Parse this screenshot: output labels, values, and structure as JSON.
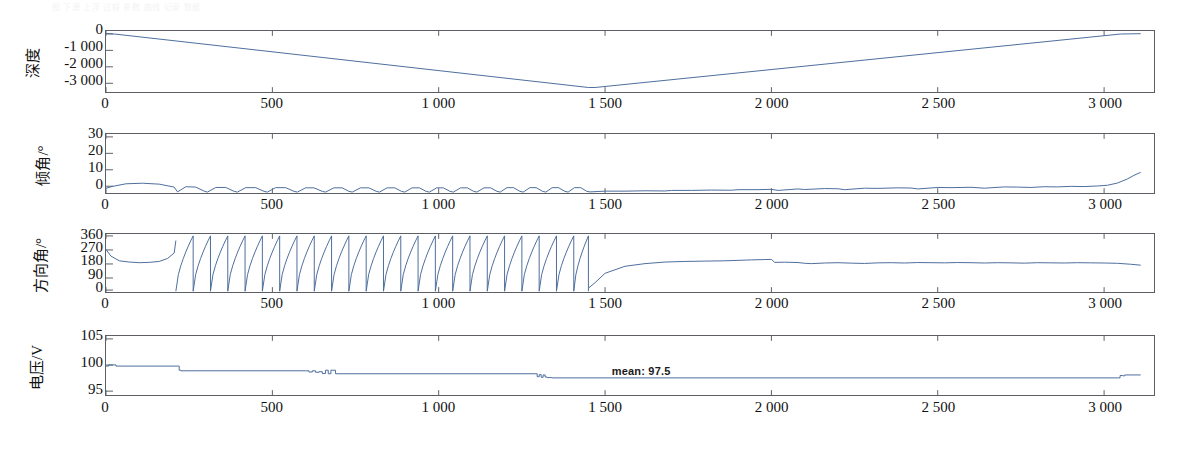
{
  "figure": {
    "ghost_caption": "图 下潜 上浮 过程 参数 曲线 记录 数据",
    "trace_color": "#4a6c9b",
    "axis_color": "#5b5f63",
    "background": "#ffffff"
  },
  "chart_data": [
    {
      "type": "line",
      "panel_index": 0,
      "title": "",
      "ylabel": "深度",
      "xlabel": "",
      "xlim": [
        0,
        3150
      ],
      "ylim": [
        -3500,
        150
      ],
      "yticks": [
        0,
        -1000,
        -2000,
        -3000
      ],
      "ytick_labels": [
        "0",
        "-1 000",
        "-2 000",
        "-3 000"
      ],
      "xticks": [
        0,
        500,
        1000,
        1500,
        2000,
        2500,
        3000
      ],
      "xtick_labels": [
        "0",
        "500",
        "1 000",
        "1 500",
        "2 000",
        "2 500",
        "3 000"
      ],
      "grid": false,
      "legend": "none",
      "series": [
        {
          "name": "深度",
          "x": [
            0,
            30,
            1450,
            1470,
            3050,
            3110
          ],
          "values": [
            0,
            -40,
            -3230,
            -3230,
            -30,
            -10
          ]
        }
      ]
    },
    {
      "type": "line",
      "panel_index": 1,
      "title": "",
      "ylabel": "倾角/°",
      "xlabel": "",
      "xlim": [
        0,
        3150
      ],
      "ylim": [
        0,
        32
      ],
      "yticks": [
        0,
        10,
        20,
        30
      ],
      "ytick_labels": [
        "0",
        "10",
        "20",
        "30"
      ],
      "xticks": [
        0,
        500,
        1000,
        1500,
        2000,
        2500,
        3000
      ],
      "xtick_labels": [
        "0",
        "500",
        "1 000",
        "1 500",
        "2 000",
        "2 500",
        "3 000"
      ],
      "grid": false,
      "legend": "none",
      "series": [
        {
          "name": "倾角",
          "x": [
            0,
            20,
            60,
            110,
            160,
            205,
            215,
            240,
            270,
            295,
            305,
            330,
            360,
            385,
            395,
            420,
            450,
            475,
            485,
            510,
            540,
            565,
            575,
            600,
            625,
            650,
            660,
            685,
            710,
            730,
            740,
            765,
            790,
            812,
            822,
            845,
            868,
            888,
            898,
            920,
            942,
            962,
            972,
            994,
            1014,
            1034,
            1044,
            1066,
            1086,
            1105,
            1115,
            1136,
            1156,
            1175,
            1185,
            1205,
            1225,
            1244,
            1254,
            1274,
            1293,
            1312,
            1322,
            1341,
            1360,
            1379,
            1389,
            1408,
            1427,
            1445,
            1455,
            1500,
            1560,
            1620,
            1680,
            1700,
            1760,
            1820,
            1880,
            1900,
            1960,
            2000,
            2020,
            2080,
            2100,
            2160,
            2200,
            2220,
            2280,
            2320,
            2380,
            2420,
            2440,
            2500,
            2540,
            2600,
            2640,
            2700,
            2740,
            2780,
            2820,
            2860,
            2900,
            2940,
            2980,
            3010,
            3040,
            3070,
            3090,
            3110
          ],
          "values": [
            2.6,
            3.6,
            5.0,
            5.3,
            4.8,
            3.2,
            0.6,
            3.4,
            3.2,
            1.0,
            0.5,
            3.0,
            3.0,
            0.9,
            0.5,
            2.9,
            2.9,
            0.9,
            0.5,
            2.9,
            2.9,
            0.9,
            0.5,
            2.8,
            2.8,
            0.9,
            0.5,
            2.8,
            2.8,
            0.9,
            0.5,
            2.8,
            2.8,
            0.9,
            0.5,
            2.8,
            2.8,
            0.9,
            0.5,
            2.8,
            2.8,
            0.9,
            0.5,
            2.8,
            2.8,
            0.9,
            0.5,
            2.8,
            2.8,
            0.9,
            0.5,
            2.8,
            2.8,
            0.9,
            0.5,
            2.9,
            2.9,
            0.9,
            0.5,
            2.9,
            2.9,
            0.9,
            0.5,
            2.9,
            2.9,
            0.9,
            0.5,
            2.9,
            2.9,
            0.9,
            0.6,
            1.0,
            1.0,
            1.2,
            1.1,
            1.4,
            1.4,
            1.6,
            1.5,
            1.8,
            1.8,
            2.0,
            1.4,
            2.2,
            1.9,
            2.4,
            2.3,
            1.8,
            2.6,
            2.5,
            2.8,
            2.7,
            2.2,
            3.0,
            2.9,
            3.1,
            2.6,
            3.3,
            3.2,
            3.0,
            3.4,
            3.3,
            3.6,
            3.5,
            3.8,
            4.2,
            5.4,
            7.6,
            9.6,
            11.2
          ]
        }
      ]
    },
    {
      "type": "line",
      "panel_index": 2,
      "title": "",
      "ylabel": "方向角/°",
      "xlabel": "",
      "xlim": [
        0,
        3150
      ],
      "ylim": [
        0,
        372
      ],
      "yticks": [
        0,
        90,
        180,
        270,
        360
      ],
      "ytick_labels": [
        "0",
        "90",
        "180",
        "270",
        "360"
      ],
      "xticks": [
        0,
        500,
        1000,
        1500,
        2000,
        2500,
        3000
      ],
      "xtick_labels": [
        "0",
        "500",
        "1 000",
        "1 500",
        "2 000",
        "2 500",
        "3 000"
      ],
      "grid": false,
      "legend": "none",
      "sawtooth_region": [
        210,
        1450
      ],
      "sawtooth_period": 52,
      "series": [
        {
          "name": "方向角",
          "x": [
            0,
            15,
            40,
            70,
            100,
            130,
            160,
            185,
            205,
            210,
            1450,
            1470,
            1500,
            1560,
            1620,
            1680,
            1740,
            1800,
            1860,
            1900,
            1940,
            1980,
            2000,
            2010,
            2040,
            2080,
            2100,
            2120,
            2160,
            2200,
            2240,
            2280,
            2320,
            2360,
            2400,
            2440,
            2480,
            2520,
            2560,
            2600,
            2640,
            2680,
            2720,
            2760,
            2800,
            2840,
            2880,
            2920,
            2960,
            3000,
            3040,
            3080,
            3110
          ],
          "values": [
            272,
            230,
            200,
            192,
            188,
            190,
            196,
            215,
            250,
            330,
            25,
            60,
            120,
            165,
            182,
            192,
            196,
            198,
            200,
            203,
            206,
            208,
            209,
            190,
            191,
            189,
            184,
            182,
            186,
            188,
            185,
            183,
            187,
            188,
            186,
            189,
            188,
            187,
            189,
            188,
            186,
            188,
            187,
            185,
            188,
            187,
            186,
            188,
            187,
            186,
            184,
            178,
            172
          ]
        }
      ]
    },
    {
      "type": "line",
      "panel_index": 3,
      "title": "",
      "ylabel": "电压/V",
      "xlabel": "",
      "xlim": [
        0,
        3150
      ],
      "ylim": [
        95,
        105
      ],
      "yticks": [
        95,
        100,
        105
      ],
      "ytick_labels": [
        "95",
        "100",
        "105"
      ],
      "xticks": [
        0,
        500,
        1000,
        1500,
        2000,
        2500,
        3000
      ],
      "xtick_labels": [
        "0",
        "500",
        "1 000",
        "1 500",
        "2 000",
        "2 500",
        "3 000"
      ],
      "grid": false,
      "legend": "none",
      "annotations": [
        {
          "text": "mean: 97.5",
          "x": 1520,
          "y": 98.1
        }
      ],
      "series": [
        {
          "name": "电压",
          "x": [
            0,
            8,
            18,
            30,
            215,
            220,
            225,
            600,
            610,
            620,
            630,
            640,
            650,
            660,
            668,
            676,
            690,
            1290,
            1296,
            1302,
            1308,
            1314,
            1320,
            1326,
            1340,
            3040,
            3048,
            3056,
            3062,
            3110
          ],
          "values": [
            99.9,
            100.1,
            100.1,
            99.9,
            99.9,
            99.2,
            99.1,
            99.1,
            98.9,
            99.1,
            98.85,
            98.95,
            98.65,
            99.2,
            98.6,
            99.2,
            98.6,
            98.6,
            98.1,
            98.45,
            98.0,
            98.4,
            98.05,
            97.95,
            97.9,
            97.9,
            98.3,
            98.25,
            98.4,
            98.4
          ]
        }
      ]
    }
  ]
}
